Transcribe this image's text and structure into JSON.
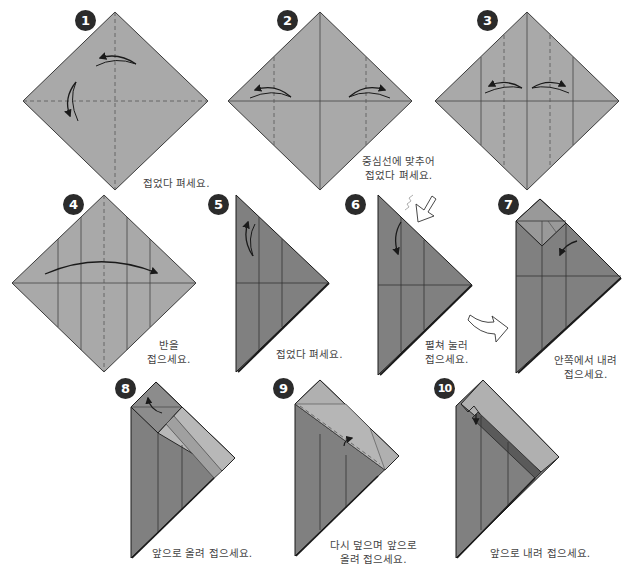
{
  "colors": {
    "paper_light": "#a9a9a9",
    "paper_dark": "#7f7f7f",
    "paper_mid": "#999999",
    "paper_flap": "#b8b8b8",
    "line": "#3a3a3a",
    "crease": "#555555",
    "badge": "#2b2b2b",
    "caption": "#444444"
  },
  "steps": [
    {
      "number": "1",
      "caption_lines": [
        "접었다 펴세요."
      ]
    },
    {
      "number": "2",
      "caption_lines": [
        "중심선에 맞추어",
        "접었다 펴세요."
      ]
    },
    {
      "number": "3",
      "caption_lines": []
    },
    {
      "number": "4",
      "caption_lines": [
        "반을",
        "접으세요."
      ]
    },
    {
      "number": "5",
      "caption_lines": [
        "접었다 펴세요."
      ]
    },
    {
      "number": "6",
      "caption_lines": [
        "펼쳐 눌러",
        "접으세요."
      ]
    },
    {
      "number": "7",
      "caption_lines": [
        "안쪽에서 내려",
        "접으세요."
      ]
    },
    {
      "number": "8",
      "caption_lines": [
        "앞으로 올려 접으세요."
      ]
    },
    {
      "number": "9",
      "caption_lines": [
        "다시 덮으며 앞으로",
        "올려 접으세요."
      ]
    },
    {
      "number": "10",
      "caption_lines": [
        "앞으로 내려 접으세요."
      ]
    }
  ],
  "icons": {
    "fold_arrow": "curved-arrow",
    "push_arrow": "hollow-push-arrow",
    "next_arrow": "hollow-curved-arrow"
  }
}
